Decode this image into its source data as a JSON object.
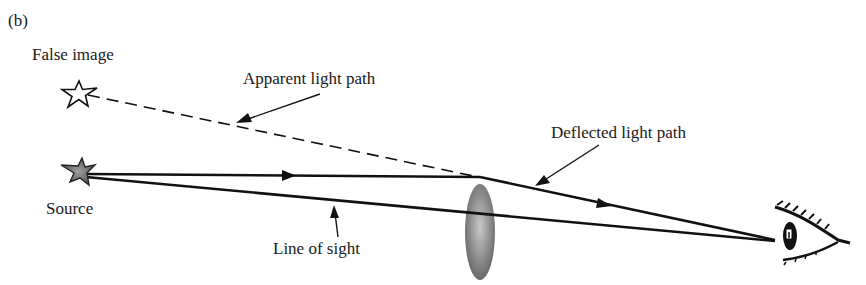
{
  "panel_label": "(b)",
  "labels": {
    "false_image": "False image",
    "apparent_path": "Apparent light path",
    "deflected_path": "Deflected light path",
    "source": "Source",
    "line_of_sight": "Line of sight"
  },
  "colors": {
    "line": "#111111",
    "lens_fill": "#8a8a8a",
    "source_star_fill": "#7a7a7a",
    "false_star_fill": "#ffffff"
  }
}
